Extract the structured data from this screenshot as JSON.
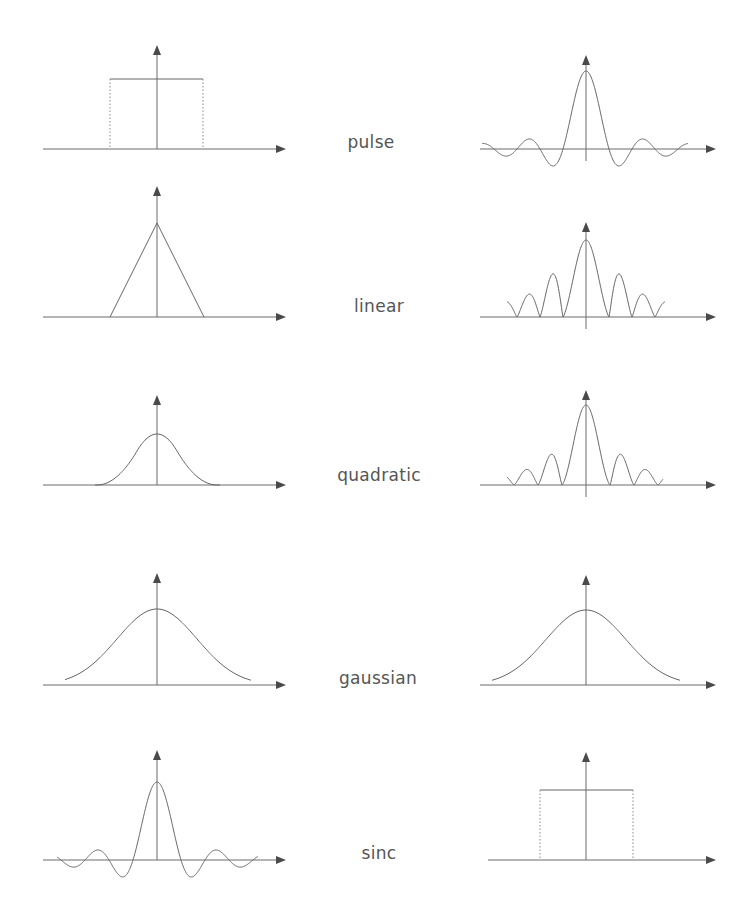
{
  "figure": {
    "rows": [
      {
        "label": "pulse",
        "left": "pulse",
        "right": "sinc"
      },
      {
        "label": "linear",
        "left": "triangle",
        "right": "sinc2"
      },
      {
        "label": "quadratic",
        "left": "quadratic",
        "right": "sinc3"
      },
      {
        "label": "gaussian",
        "left": "gaussian",
        "right": "gaussian"
      },
      {
        "label": "sinc",
        "left": "sinc",
        "right": "pulse"
      }
    ]
  },
  "layout": {
    "left_axis_x": 157,
    "right_axis_x": 586,
    "left_xaxis": [
      43,
      286
    ],
    "right_xaxis": [
      480,
      716
    ],
    "label_x": 380,
    "rows": [
      {
        "baseline": 149,
        "arrow_top": 45,
        "peak": 79,
        "label_top": 132
      },
      {
        "baseline": 317,
        "arrow_top": 186,
        "peak": 223,
        "label_top": 296
      },
      {
        "baseline": 485,
        "arrow_top": 395,
        "peak": 434,
        "label_top": 465
      },
      {
        "baseline": 685,
        "arrow_top": 573,
        "peak": 609,
        "label_top": 668
      },
      {
        "baseline": 860,
        "arrow_top": 750,
        "peak": 782,
        "label_top": 843
      }
    ],
    "right_peaks": [
      71,
      240,
      405,
      610,
      790
    ],
    "right_arrow_tops": [
      55,
      222,
      390,
      575,
      752
    ]
  },
  "colors": {
    "axis": "#6a6a6a",
    "curve": "#666666",
    "arrowhead": "#4a4a4a",
    "label": "#555555",
    "background": "#ffffff"
  }
}
